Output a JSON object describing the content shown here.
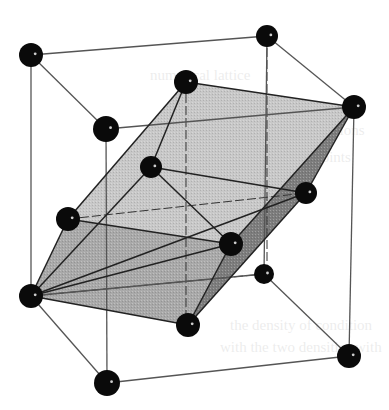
{
  "figure": {
    "colors": {
      "atom": "#0a0a0a",
      "edge": "#555555",
      "face_light": "#c8c8c8",
      "face_mid": "#a9a9a9",
      "face_dark": "#7d7d7d",
      "bond": "#222222"
    },
    "atoms": [
      {
        "id": "A",
        "x": 31,
        "y": 55,
        "r": 12
      },
      {
        "id": "B",
        "x": 267,
        "y": 36,
        "r": 11
      },
      {
        "id": "C",
        "x": 106,
        "y": 129,
        "r": 13
      },
      {
        "id": "D",
        "x": 354,
        "y": 107,
        "r": 12
      },
      {
        "id": "E",
        "x": 186,
        "y": 82,
        "r": 12
      },
      {
        "id": "F",
        "x": 151,
        "y": 167,
        "r": 11
      },
      {
        "id": "G",
        "x": 306,
        "y": 193,
        "r": 11
      },
      {
        "id": "H",
        "x": 68,
        "y": 219,
        "r": 12
      },
      {
        "id": "I",
        "x": 231,
        "y": 244,
        "r": 12
      },
      {
        "id": "J",
        "x": 264,
        "y": 274,
        "r": 10
      },
      {
        "id": "K",
        "x": 31,
        "y": 296,
        "r": 12
      },
      {
        "id": "L",
        "x": 188,
        "y": 325,
        "r": 12
      },
      {
        "id": "M",
        "x": 349,
        "y": 356,
        "r": 12
      },
      {
        "id": "N",
        "x": 107,
        "y": 383,
        "r": 13
      }
    ],
    "cube_edges": [
      [
        "A",
        "B"
      ],
      [
        "A",
        "C"
      ],
      [
        "B",
        "D"
      ],
      [
        "C",
        "D"
      ],
      [
        "A",
        "K"
      ],
      [
        "C",
        "N"
      ],
      [
        "D",
        "M"
      ],
      [
        "B",
        "J"
      ],
      [
        "K",
        "N"
      ],
      [
        "N",
        "M"
      ],
      [
        "M",
        "J"
      ],
      [
        "J",
        "K"
      ]
    ],
    "faces": [
      {
        "name": "top-face",
        "points": [
          "E",
          "D",
          "I",
          "H"
        ],
        "shade": "face_light"
      },
      {
        "name": "bottom-face",
        "points": [
          "H",
          "I",
          "L",
          "K"
        ],
        "shade": "face_mid"
      },
      {
        "name": "side-face",
        "points": [
          "D",
          "G",
          "L",
          "I"
        ],
        "shade": "face_dark"
      }
    ],
    "bonds": [
      [
        "E",
        "D"
      ],
      [
        "E",
        "H"
      ],
      [
        "D",
        "I"
      ],
      [
        "H",
        "I"
      ],
      [
        "E",
        "F"
      ],
      [
        "F",
        "G"
      ],
      [
        "F",
        "K"
      ],
      [
        "F",
        "I"
      ],
      [
        "H",
        "K"
      ],
      [
        "K",
        "L"
      ],
      [
        "I",
        "L"
      ],
      [
        "G",
        "L"
      ],
      [
        "D",
        "G"
      ],
      [
        "K",
        "G"
      ],
      [
        "K",
        "I"
      ]
    ],
    "dashed_lines": [
      {
        "x1": 186,
        "y1": 82,
        "x2": 186,
        "y2": 318
      },
      {
        "x1": 267,
        "y1": 36,
        "x2": 267,
        "y2": 264
      },
      {
        "x1": 68,
        "y1": 219,
        "x2": 306,
        "y2": 193
      },
      {
        "x1": 31,
        "y1": 296,
        "x2": 264,
        "y2": 274
      }
    ]
  },
  "ghost_text": [
    {
      "text": "numerical lattice",
      "x": 150,
      "y": 80
    },
    {
      "text": "two dimensions",
      "x": 270,
      "y": 135
    },
    {
      "text": "of its points",
      "x": 280,
      "y": 162
    },
    {
      "text": "the density of condition",
      "x": 230,
      "y": 330
    },
    {
      "text": "with the two densities with",
      "x": 220,
      "y": 352
    }
  ]
}
